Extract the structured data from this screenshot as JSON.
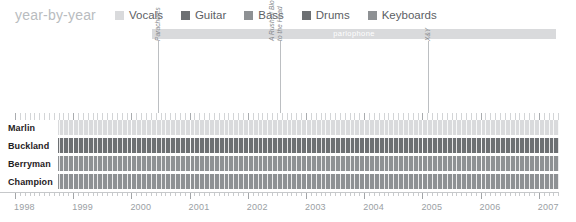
{
  "header": {
    "title": "year-by-year",
    "legend": [
      {
        "label": "Vocals",
        "color": "#d9dadc",
        "icon": "legend-swatch-icon"
      },
      {
        "label": "Guitar",
        "color": "#6d7073",
        "icon": "legend-swatch-icon"
      },
      {
        "label": "Bass",
        "color": "#8e9194",
        "icon": "legend-swatch-icon"
      },
      {
        "label": "Drums",
        "color": "#6d7073",
        "icon": "legend-swatch-icon"
      },
      {
        "label": "Keyboards",
        "color": "#8e9194",
        "icon": "legend-swatch-icon"
      }
    ]
  },
  "label_bar": {
    "text": "parlophone",
    "start_year": 2000.35,
    "end_year": 2007.3,
    "color": "#d9dadc",
    "text_color": "#ffffff"
  },
  "markers": [
    {
      "name": "Parachutes",
      "lines": [
        "Parachutes"
      ],
      "year": 2000.45
    },
    {
      "name": "A Rush of Blood to the Head",
      "lines": [
        "A Rush of Blood",
        "to the Head"
      ],
      "year": 2002.55
    },
    {
      "name": "X&Y",
      "lines": [
        "X&Y"
      ],
      "year": 2005.1
    }
  ],
  "rows": [
    {
      "name": "Marlin",
      "color": "#d9dadc",
      "role": "Vocals"
    },
    {
      "name": "Buckland",
      "color": "#6d7073",
      "role": "Guitar"
    },
    {
      "name": "Berryman",
      "color": "#8e9194",
      "role": "Bass"
    },
    {
      "name": "Champion",
      "color": "#8e9194",
      "role": "Drums"
    }
  ],
  "axis": {
    "ticks_per_year": 12,
    "years": [
      "1998",
      "1999",
      "2000",
      "2001",
      "2002",
      "2003",
      "2004",
      "2005",
      "2006",
      "2007"
    ],
    "start_year": 1998,
    "end_year": 2007.35,
    "label_color": "#9aa0a4"
  },
  "chart_data": {
    "type": "table",
    "title": "year-by-year",
    "xlabel": "",
    "ylabel": "",
    "xlim": [
      1998,
      2007.35
    ],
    "grid": true,
    "legend_position": "top",
    "categories": [
      "Marlin",
      "Buckland",
      "Berryman",
      "Champion"
    ],
    "series": [
      {
        "name": "Marlin",
        "instrument": "Vocals",
        "value": "#d9dadc",
        "span": [
          1998,
          2007.35
        ]
      },
      {
        "name": "Buckland",
        "instrument": "Guitar",
        "value": "#6d7073",
        "span": [
          1998,
          2007.35
        ]
      },
      {
        "name": "Berryman",
        "instrument": "Bass",
        "value": "#8e9194",
        "span": [
          1998,
          2007.35
        ]
      },
      {
        "name": "Champion",
        "instrument": "Drums",
        "value": "#8e9194",
        "span": [
          1998,
          2007.35
        ]
      }
    ],
    "annotations": [
      {
        "text": "Parachutes",
        "x": 2000.45
      },
      {
        "text": "A Rush of Blood to the Head",
        "x": 2002.55
      },
      {
        "text": "X&Y",
        "x": 2005.1
      },
      {
        "text": "parlophone",
        "x0": 2000.35,
        "x1": 2007.3
      }
    ]
  }
}
